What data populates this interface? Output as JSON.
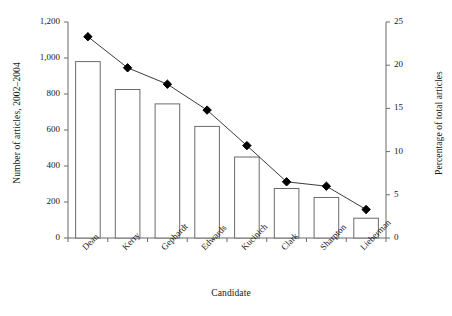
{
  "chart_data": {
    "type": "bar",
    "title": "",
    "subtitle": "",
    "xlabel": "Candidate",
    "ylabel": "Number of articles, 2002–2004",
    "y2label": "Percentage of total articles",
    "categories": [
      "Dean",
      "Kerry",
      "Gephardt",
      "Edwards",
      "Kucinich",
      "Clark",
      "Sharpton",
      "Lieberman"
    ],
    "series": [
      {
        "name": "Number of articles, 2002–2004",
        "type": "bar",
        "axis": "left",
        "values": [
          980,
          825,
          745,
          620,
          450,
          275,
          225,
          110
        ]
      },
      {
        "name": "Percentage of total articles",
        "type": "line",
        "axis": "right",
        "marker": "diamond",
        "values": [
          23.3,
          19.7,
          17.8,
          14.8,
          10.7,
          6.5,
          6.0,
          3.3
        ]
      }
    ],
    "ylim": [
      0,
      1200
    ],
    "yticks": [
      0,
      200,
      400,
      600,
      800,
      1000,
      1200
    ],
    "ytick_labels": [
      "0",
      "200",
      "400",
      "600",
      "800",
      "1,000",
      "1,200"
    ],
    "y2lim": [
      0,
      25
    ],
    "y2ticks": [
      0,
      5,
      10,
      15,
      20,
      25
    ],
    "y2tick_labels": [
      "0",
      "5",
      "10",
      "15",
      "20",
      "25"
    ],
    "grid": false,
    "legend": "none",
    "bar_fill": "#ffffff",
    "bar_stroke": "#6b6b6b",
    "line_color": "#3c3c3c",
    "marker_color": "#000000",
    "axis_color": "#6b6b6b",
    "text_color": "#161616"
  }
}
